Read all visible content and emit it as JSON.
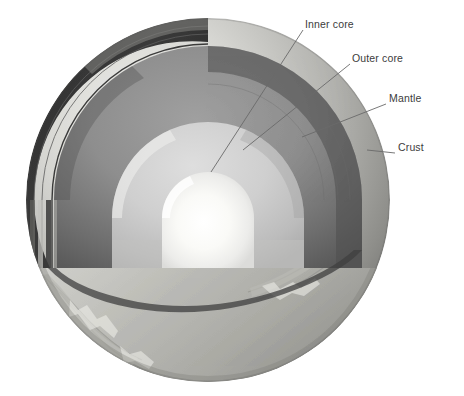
{
  "figure": {
    "type": "cutaway-diagram",
    "background_color": "#ffffff",
    "text_color": "#3c3c3c"
  },
  "labels": [
    {
      "id": "inner-core",
      "text": "Inner core",
      "x": 305,
      "y": 19,
      "leader": {
        "from_x": 303,
        "from_y": 30,
        "to_x": 211,
        "to_y": 172
      },
      "color": "#f2f2f0"
    },
    {
      "id": "outer-core",
      "text": "Outer core",
      "x": 352,
      "y": 53,
      "leader": {
        "from_x": 350,
        "from_y": 64,
        "to_x": 243,
        "to_y": 150
      },
      "color": "#c9c9c7"
    },
    {
      "id": "mantle",
      "text": "Mantle",
      "x": 389,
      "y": 93,
      "leader": {
        "from_x": 386,
        "from_y": 104,
        "to_x": 302,
        "to_y": 137
      },
      "color": "#7c7c7c"
    },
    {
      "id": "crust",
      "text": "Crust",
      "x": 398,
      "y": 142,
      "leader": {
        "from_x": 395,
        "from_y": 153,
        "to_x": 367,
        "to_y": 150
      },
      "color": "#3e3e3e"
    }
  ],
  "sphere": {
    "center_x": 208,
    "center_y": 200,
    "radius": 182,
    "cut_plane_y": 268
  },
  "layers": [
    {
      "name": "Crust",
      "shade": "#3b3b3b"
    },
    {
      "name": "Mantle",
      "shade": "#8a8a8a"
    },
    {
      "name": "Outer core",
      "shade": "#cccccb"
    },
    {
      "name": "Inner core",
      "shade": "#f6f6f3"
    }
  ]
}
